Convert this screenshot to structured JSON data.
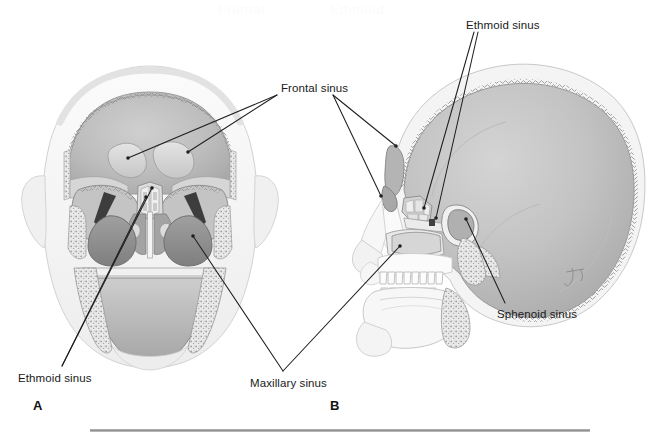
{
  "figure": {
    "view_a_description": "Coronal (frontal) section of the skull showing frontal, ethmoid and maxillary sinuses",
    "view_b_description": "Sagittal (lateral) section of the skull showing frontal, ethmoid, sphenoid and maxillary sinuses",
    "background_color": "#ffffff",
    "ink_color": "#1a1a1a",
    "bone_light": "#f2f2f2",
    "bone_mid": "#c9c9c9",
    "cavity_dark": "#8f8f8f",
    "cavity_darkest": "#4a4a4a"
  },
  "panels": [
    {
      "letter": "A",
      "x": 33,
      "y": 398
    },
    {
      "letter": "B",
      "x": 330,
      "y": 398
    }
  ],
  "labels": [
    {
      "id": "frontal-sinus",
      "text": "Frontal sinus",
      "x": 281,
      "y": 82,
      "leaders": [
        {
          "from": [
            277,
            95
          ],
          "to": [
            128,
            158
          ]
        },
        {
          "from": [
            277,
            95
          ],
          "to": [
            188,
            152
          ]
        },
        {
          "from": [
            333,
            95
          ],
          "to": [
            396,
            146
          ]
        },
        {
          "from": [
            333,
            95
          ],
          "to": [
            381,
            196
          ]
        }
      ]
    },
    {
      "id": "ethmoid-sinus-b",
      "text": "Ethmoid sinus",
      "x": 466,
      "y": 19,
      "leaders": [
        {
          "from": [
            474,
            32
          ],
          "to": [
            424,
            208
          ]
        },
        {
          "from": [
            478,
            32
          ],
          "to": [
            436,
            218
          ]
        }
      ]
    },
    {
      "id": "sphenoid-sinus",
      "text": "Sphenoid sinus",
      "x": 497,
      "y": 308,
      "leaders": [
        {
          "from": [
            505,
            303
          ],
          "to": [
            466,
            219
          ]
        }
      ]
    },
    {
      "id": "ethmoid-sinus-a",
      "text": "Ethmoid sinus",
      "x": 18,
      "y": 372,
      "leaders": [
        {
          "from": [
            62,
            366
          ],
          "to": [
            146,
            197
          ]
        },
        {
          "from": [
            62,
            366
          ],
          "to": [
            152,
            188
          ]
        }
      ]
    },
    {
      "id": "maxillary-sinus",
      "text": "Maxillary sinus",
      "x": 250,
      "y": 377,
      "leaders": [
        {
          "from": [
            283,
            371
          ],
          "to": [
            193,
            236
          ]
        },
        {
          "from": [
            283,
            371
          ],
          "to": [
            400,
            246
          ]
        }
      ]
    }
  ],
  "ghost_text": [
    {
      "text": "Frontal",
      "x": 218,
      "y": 2
    },
    {
      "text": "Ethmoid",
      "x": 330,
      "y": 2
    }
  ],
  "rule": {
    "x": 90,
    "y": 429,
    "width": 500
  }
}
